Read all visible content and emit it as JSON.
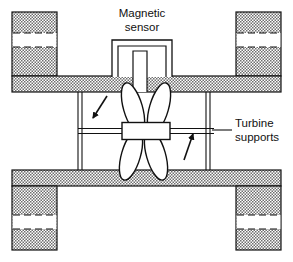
{
  "figure": {
    "name": "turbine-flowmeter-cross-section",
    "width": 293,
    "height": 262,
    "background_color": "#ffffff"
  },
  "colors": {
    "line": "#111111",
    "hatch_dark": "#6e6e6e",
    "hatch_light": "#d8d8d8",
    "white": "#ffffff",
    "text": "#111111"
  },
  "labels": {
    "magnetic_sensor": {
      "line1": "Magnetic",
      "line2": "sensor"
    },
    "turbine_supports": {
      "line1": "Turbine",
      "line2": "supports"
    }
  },
  "components": {
    "sensor_housing": "magnetic-sensor-housing",
    "sensor_stem": "magnetic-sensor-stem",
    "pipe_body": "pipe-body-wall",
    "flange_top_left": "flange-top-left",
    "flange_top_right": "flange-top-right",
    "flange_bottom_left": "flange-bottom-left",
    "flange_bottom_right": "flange-bottom-right",
    "bolt_hole_top_left": "bolt-hole-top-left",
    "bolt_hole_top_right": "bolt-hole-top-right",
    "bolt_hole_bottom_left": "bolt-hole-bottom-left",
    "bolt_hole_bottom_right": "bolt-hole-bottom-right",
    "rotor_hub": "turbine-rotor-hub",
    "blades": [
      "turbine-blade-upper-left",
      "turbine-blade-upper-right",
      "turbine-blade-lower-left",
      "turbine-blade-lower-right"
    ],
    "shaft": "turbine-shaft",
    "support_left": "turbine-support-strut-left",
    "support_right": "turbine-support-strut-right",
    "rotation_arrow_left": "rotation-arrow-left",
    "rotation_arrow_right": "rotation-arrow-right",
    "leader_line": "turbine-supports-leader-line"
  },
  "geometry": {
    "outer_left": 12,
    "outer_right": 281,
    "outer_top": 12,
    "outer_bottom": 250,
    "wall_band_top_y": 76,
    "wall_band_top_h": 16,
    "wall_band_bottom_y": 170,
    "wall_band_bottom_h": 16,
    "flange_width": 45,
    "bore_top": 92,
    "bore_bottom": 170,
    "shaft_y": 131,
    "hub_x": 122,
    "hub_y": 123,
    "hub_w": 48,
    "hub_h": 17
  }
}
